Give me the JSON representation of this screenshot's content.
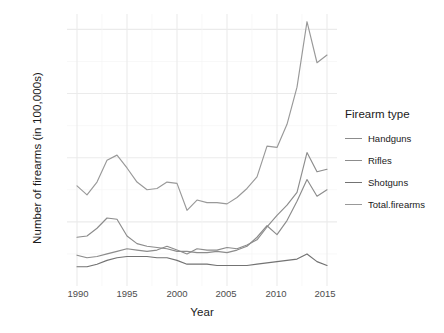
{
  "chart_data": {
    "type": "line",
    "title": "",
    "xlabel": "Year",
    "ylabel": "Number of firearms (in 100,000s)",
    "legend_title": "Firearm type",
    "legend_position": "right",
    "grid": true,
    "xlim": [
      1989,
      2016
    ],
    "ylim": [
      0,
      106
    ],
    "xticks": [
      "1990",
      "1995",
      "2000",
      "2005",
      "2010",
      "2015"
    ],
    "xtick_values": [
      1990,
      1995,
      2000,
      2005,
      2010,
      2015
    ],
    "yticks": [
      "25",
      "50",
      "75",
      "100"
    ],
    "ytick_values": [
      25,
      50,
      75,
      100
    ],
    "x": [
      1990,
      1991,
      1992,
      1993,
      1994,
      1995,
      1996,
      1997,
      1998,
      1999,
      2000,
      2001,
      2002,
      2003,
      2004,
      2005,
      2006,
      2007,
      2008,
      2009,
      2010,
      2011,
      2012,
      2013,
      2014,
      2015
    ],
    "series": [
      {
        "name": "Handguns",
        "color": "#8c8c8c",
        "values": [
          19.0,
          19.5,
          22.5,
          26.5,
          26.0,
          19.5,
          16.5,
          15.5,
          15.0,
          14.5,
          13.5,
          13.5,
          13.0,
          13.0,
          13.5,
          13.0,
          14.0,
          15.5,
          19.0,
          23.5,
          20.0,
          25.5,
          33.0,
          41.5,
          35.0,
          37.5
        ]
      },
      {
        "name": "Rifles",
        "color": "#8c8c8c",
        "values": [
          12.0,
          11.0,
          11.5,
          12.5,
          13.5,
          14.5,
          14.0,
          13.5,
          14.0,
          15.5,
          14.0,
          12.5,
          14.5,
          14.0,
          14.0,
          15.0,
          14.5,
          16.0,
          18.0,
          23.0,
          27.5,
          31.5,
          36.5,
          52.0,
          44.5,
          45.5
        ]
      },
      {
        "name": "Shotguns",
        "color": "#737373",
        "values": [
          7.5,
          7.5,
          8.5,
          10.0,
          11.0,
          11.5,
          11.5,
          11.5,
          11.0,
          11.0,
          10.0,
          8.5,
          8.5,
          8.5,
          8.0,
          8.0,
          8.0,
          8.0,
          8.5,
          9.0,
          9.5,
          10.0,
          10.5,
          12.5,
          9.5,
          8.0
        ]
      },
      {
        "name": "Total.firearms",
        "color": "#999999",
        "values": [
          39.0,
          35.5,
          40.5,
          49.0,
          51.0,
          46.0,
          40.5,
          37.5,
          38.0,
          40.5,
          40.0,
          29.5,
          33.5,
          32.5,
          32.5,
          32.0,
          34.5,
          38.0,
          42.5,
          54.5,
          54.0,
          63.0,
          77.5,
          103.0,
          87.0,
          90.0
        ]
      }
    ]
  },
  "axis": {
    "y_title": "Number of firearms (in 100,000s)",
    "x_title": "Year"
  },
  "legend": {
    "title": "Firearm type",
    "items": [
      {
        "label": "Handguns"
      },
      {
        "label": "Rifles"
      },
      {
        "label": "Shotguns"
      },
      {
        "label": "Total.firearms"
      }
    ]
  },
  "yticks": [
    {
      "label": "100"
    },
    {
      "label": "75"
    },
    {
      "label": "50"
    },
    {
      "label": "25"
    }
  ],
  "xticks": [
    {
      "label": "1990"
    },
    {
      "label": "1995"
    },
    {
      "label": "2000"
    },
    {
      "label": "2005"
    },
    {
      "label": "2010"
    },
    {
      "label": "2015"
    }
  ]
}
